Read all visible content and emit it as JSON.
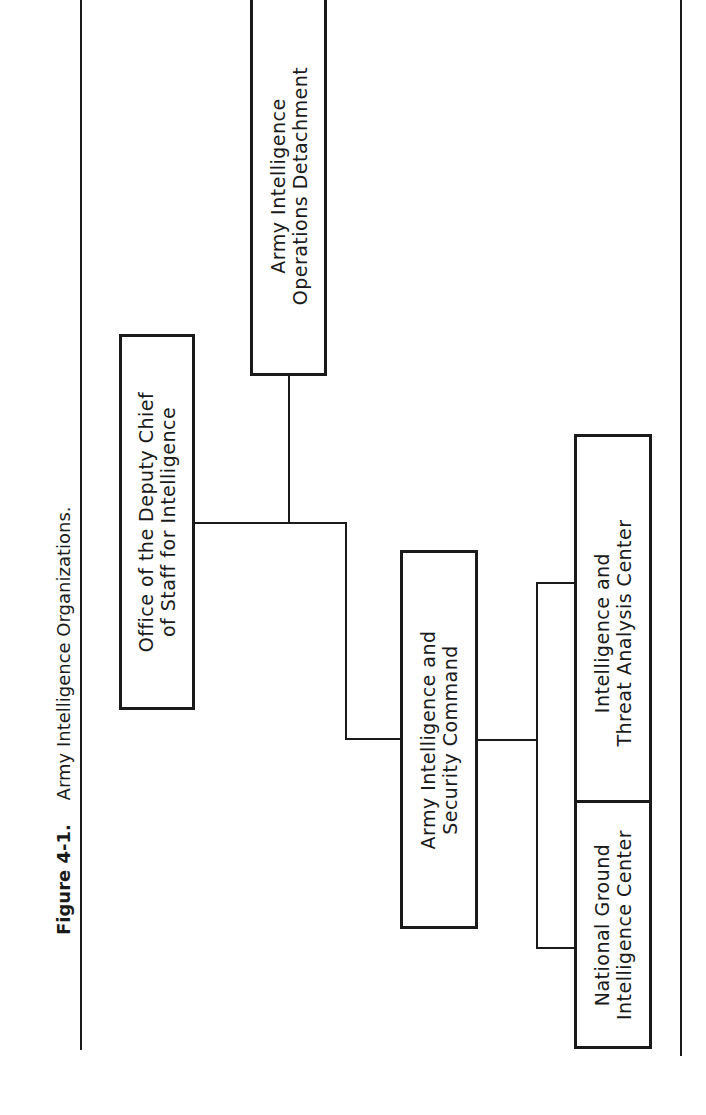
{
  "caption": {
    "figure_number": "Figure 4-1.",
    "title": "Army Intelligence Organizations."
  },
  "nodes": [
    {
      "id": "odcsi",
      "lines": [
        "Office of the Deputy Chief",
        "of Staff for Intelligence"
      ]
    },
    {
      "id": "aiod",
      "lines": [
        "Army Intelligence",
        "Operations Detachment"
      ]
    },
    {
      "id": "inscom",
      "lines": [
        "Army Intelligence and",
        "Security Command"
      ]
    },
    {
      "id": "itac",
      "lines": [
        "Intelligence and",
        "Threat Analysis Center"
      ]
    },
    {
      "id": "ngic",
      "lines": [
        "National Ground",
        "Intelligence Center"
      ]
    }
  ],
  "edges": [
    {
      "from": "odcsi",
      "to": "aiod"
    },
    {
      "from": "odcsi",
      "to": "inscom"
    },
    {
      "from": "inscom",
      "to": "itac"
    },
    {
      "from": "inscom",
      "to": "ngic"
    }
  ],
  "orientation": "rotated 90 degrees counter-clockwise"
}
